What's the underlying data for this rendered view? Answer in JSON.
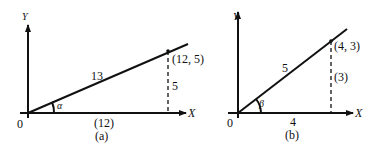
{
  "figure_a": {
    "axis_y": "Y",
    "axis_x": "X",
    "origin": "0",
    "hypotenuse": "13",
    "point": "(12, 5)",
    "opposite": "5",
    "adjacent": "(12)",
    "angle": "α",
    "caption": "(a)"
  },
  "figure_b": {
    "axis_y": "Y",
    "axis_x": "X",
    "origin": "0",
    "hypotenuse": "5",
    "point": "(4, 3)",
    "opposite": "(3)",
    "adjacent": "4",
    "angle": "β",
    "caption": "(b)"
  },
  "colors": {
    "ink": "#111111",
    "background": "#ffffff"
  }
}
